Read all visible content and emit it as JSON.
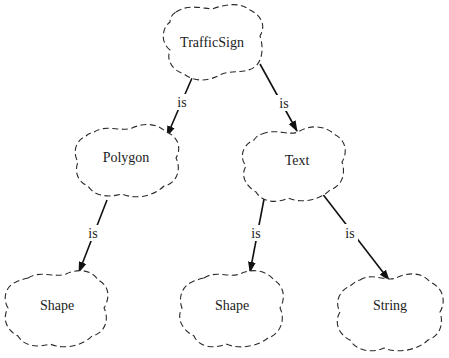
{
  "diagram": {
    "type": "inheritance-tree",
    "nodes": [
      {
        "id": "trafficsign",
        "label": "TrafficSign"
      },
      {
        "id": "polygon",
        "label": "Polygon"
      },
      {
        "id": "text",
        "label": "Text"
      },
      {
        "id": "shape1",
        "label": "Shape"
      },
      {
        "id": "shape2",
        "label": "Shape"
      },
      {
        "id": "string",
        "label": "String"
      }
    ],
    "edges": [
      {
        "from": "trafficsign",
        "to": "polygon",
        "label": "is"
      },
      {
        "from": "trafficsign",
        "to": "text",
        "label": "is"
      },
      {
        "from": "polygon",
        "to": "shape1",
        "label": "is"
      },
      {
        "from": "text",
        "to": "shape2",
        "label": "is"
      },
      {
        "from": "text",
        "to": "string",
        "label": "is"
      }
    ],
    "colors": {
      "stroke": "#2a2a2a",
      "edge": "#111111",
      "text": "#222222",
      "background": "#ffffff"
    }
  }
}
